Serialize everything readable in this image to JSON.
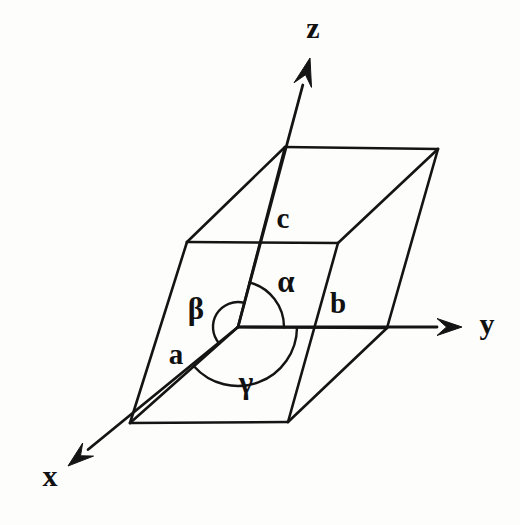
{
  "figure": {
    "type": "line-diagram",
    "background_color": "#fdfdfc",
    "ink_color": "#141414"
  },
  "axes": [
    {
      "id": "x",
      "label": "x",
      "label_x": 50,
      "label_y": 479,
      "tip_x": 68,
      "tip_y": 466,
      "origin_x": 238,
      "origin_y": 327,
      "direction": "down-left"
    },
    {
      "id": "y",
      "label": "y",
      "label_x": 487,
      "label_y": 327,
      "tip_x": 462,
      "tip_y": 327,
      "origin_x": 238,
      "origin_y": 327,
      "direction": "right"
    },
    {
      "id": "z",
      "label": "z",
      "label_x": 313,
      "label_y": 31,
      "tip_x": 310,
      "tip_y": 58,
      "origin_x": 238,
      "origin_y": 327,
      "direction": "up-right"
    }
  ],
  "edge_labels": [
    {
      "id": "a",
      "label": "a",
      "x": 176,
      "y": 357,
      "describes": "cell edge along x axis"
    },
    {
      "id": "b",
      "label": "b",
      "x": 338,
      "y": 306,
      "describes": "cell edge along y axis"
    },
    {
      "id": "c",
      "label": "c",
      "x": 283,
      "y": 221,
      "describes": "cell edge along z axis"
    }
  ],
  "angle_labels": [
    {
      "id": "alpha",
      "label": "α",
      "x": 286,
      "y": 285,
      "describes": "angle between b and c"
    },
    {
      "id": "beta",
      "label": "β",
      "x": 196,
      "y": 312,
      "describes": "angle between a and c"
    },
    {
      "id": "gamma",
      "label": "γ",
      "x": 246,
      "y": 386,
      "describes": "angle between a and b"
    }
  ],
  "geometry": {
    "origin": {
      "x": 238,
      "y": 327
    },
    "vertex_a": {
      "x": 130,
      "y": 423
    },
    "vertex_b": {
      "x": 387,
      "y": 328
    },
    "vertex_c": {
      "x": 285,
      "y": 147
    },
    "vertex_ab": {
      "x": 288,
      "y": 422
    },
    "vertex_ac": {
      "x": 187,
      "y": 242
    },
    "vertex_bc": {
      "x": 438,
      "y": 149
    },
    "vertex_abc": {
      "x": 338,
      "y": 243
    }
  }
}
